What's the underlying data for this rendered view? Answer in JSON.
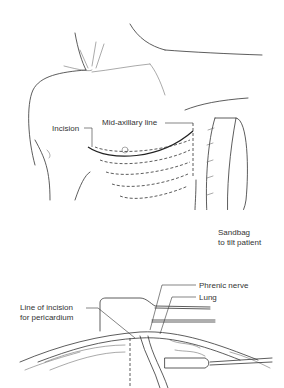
{
  "figure": {
    "top_panel": {
      "description": "Patient torso positioned for anterolateral thoracotomy",
      "labels": {
        "incision": "Incision",
        "mid_axillary": "Mid-axillary line",
        "sandbag_line1": "Sandbag",
        "sandbag_line2": "to tilt patient"
      }
    },
    "bottom_panel": {
      "description": "Opened chest exposing pericardium, phrenic nerve and lung",
      "labels": {
        "phrenic_nerve": "Phrenic nerve",
        "lung": "Lung",
        "incision_line1": "Line of incision",
        "incision_line2": "for pericardium"
      }
    }
  }
}
